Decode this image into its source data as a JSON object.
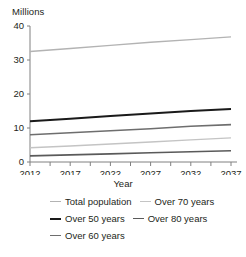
{
  "chart_data": {
    "type": "line",
    "title": "",
    "ylabel": "Millions",
    "xlabel": "Year",
    "x": [
      2012,
      2017,
      2022,
      2027,
      2032,
      2037
    ],
    "xlim": [
      2012,
      2037
    ],
    "ylim": [
      0,
      40
    ],
    "yticks": [
      "0",
      "10",
      "20",
      "30",
      "40"
    ],
    "ytick_values": [
      0,
      10,
      20,
      30,
      40
    ],
    "xticks": [
      "2012",
      "2017",
      "2022",
      "2027",
      "2032",
      "2037"
    ],
    "grid": false,
    "legend_position": "bottom",
    "series": [
      {
        "name": "Total population",
        "color": "#b3b3b3",
        "width": 1.4,
        "values": [
          32.5,
          33.4,
          34.3,
          35.2,
          36.0,
          36.8
        ]
      },
      {
        "name": "Over 50 years",
        "color": "#1a1a1a",
        "width": 2.0,
        "values": [
          12.0,
          12.7,
          13.5,
          14.3,
          15.0,
          15.6
        ]
      },
      {
        "name": "Over 60 years",
        "color": "#6e6e6e",
        "width": 1.6,
        "values": [
          8.0,
          8.6,
          9.2,
          9.8,
          10.5,
          11.0
        ]
      },
      {
        "name": "Over 70 years",
        "color": "#c4c4c4",
        "width": 1.4,
        "values": [
          4.2,
          4.7,
          5.3,
          5.9,
          6.5,
          7.1
        ]
      },
      {
        "name": "Over 80 years",
        "color": "#5a5a5a",
        "width": 1.6,
        "values": [
          1.8,
          2.1,
          2.4,
          2.7,
          3.0,
          3.3
        ]
      }
    ]
  },
  "legend": {
    "rows": [
      [
        {
          "label": "Total population",
          "color": "#b3b3b3",
          "width": 1.4
        },
        {
          "label": "Over 70 years",
          "color": "#c4c4c4",
          "width": 1.4
        }
      ],
      [
        {
          "label": "Over 50 years",
          "color": "#1a1a1a",
          "width": 2.0
        },
        {
          "label": "Over 80 years",
          "color": "#5a5a5a",
          "width": 1.6
        }
      ],
      [
        {
          "label": "Over 60 years",
          "color": "#6e6e6e",
          "width": 1.6
        }
      ]
    ]
  },
  "axis": {
    "color": "#808080"
  }
}
